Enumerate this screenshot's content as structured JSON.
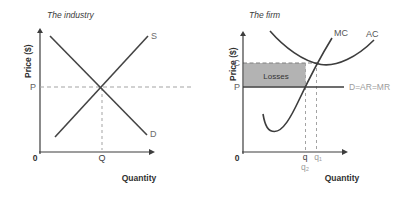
{
  "colors": {
    "axis": "#3d3d3d",
    "curve": "#3d3d3d",
    "dashed_line": "#a3a3a3",
    "losses_fill": "#b3b3b3",
    "label_dark": "#3b3b3b",
    "label_gray": "#9c9c9c",
    "background": "#ffffff"
  },
  "industry": {
    "title": "The industry",
    "y_axis_label": "Price ($)",
    "x_axis_label": "Quantity",
    "origin_label": "0",
    "supply_curve_label": "S",
    "demand_curve_label": "D",
    "price_label": "P",
    "quantity_label": "Q"
  },
  "firm": {
    "title": "The firm",
    "y_axis_label": "Price ($)",
    "x_axis_label": "Quantity",
    "origin_label": "0",
    "cost_label": "C",
    "price_label": "P",
    "mc_curve_label": "MC",
    "ac_curve_label": "AC",
    "losses_area_label": "Losses",
    "demand_line_label": "D=AR=MR",
    "q_label": "q",
    "q1_label": "q₁",
    "q2_label": "q₂"
  }
}
